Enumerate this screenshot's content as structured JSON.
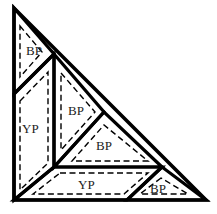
{
  "diagram": {
    "type": "quilt-block-layout",
    "pieces": [
      {
        "id": "top-triangle",
        "label": "BP",
        "shape": "triangle",
        "points": "14,8 54,54 14,94",
        "seam": "20,26 42,52 20,77",
        "text_x": 26,
        "text_y": 55
      },
      {
        "id": "left-parallelogram",
        "label": "YP",
        "shape": "parallelogram",
        "points": "14,94 54,54 54,167 14,200",
        "seam": "20,101 48,72 48,163 20,190",
        "text_x": 22,
        "text_y": 133
      },
      {
        "id": "middle-triangle",
        "label": "BP",
        "shape": "triangle",
        "points": "54,54 104,112 54,167",
        "seam": "61,73 95,112 61,150",
        "text_x": 68,
        "text_y": 115
      },
      {
        "id": "lower-triangle",
        "label": "BP",
        "shape": "triangle",
        "points": "54,167 104,112 162,167",
        "seam": "72,161 104,125 148,161",
        "text_x": 96,
        "text_y": 150
      },
      {
        "id": "bottom-parallelogram",
        "label": "YP",
        "shape": "parallelogram",
        "points": "54,167 162,167 127,200 14,200",
        "seam": "60,173 148,173 124,194 33,194",
        "text_x": 78,
        "text_y": 189
      },
      {
        "id": "corner-triangle",
        "label": "BP",
        "shape": "triangle",
        "points": "162,167 127,200 206,200",
        "seam": "161,178 140,194 188,194",
        "text_x": 150,
        "text_y": 193
      }
    ],
    "outer": {
      "points": "14,8 14,200 206,200"
    },
    "colors": {
      "line": "#000000",
      "background": "#ffffff",
      "text": "#222222"
    }
  }
}
